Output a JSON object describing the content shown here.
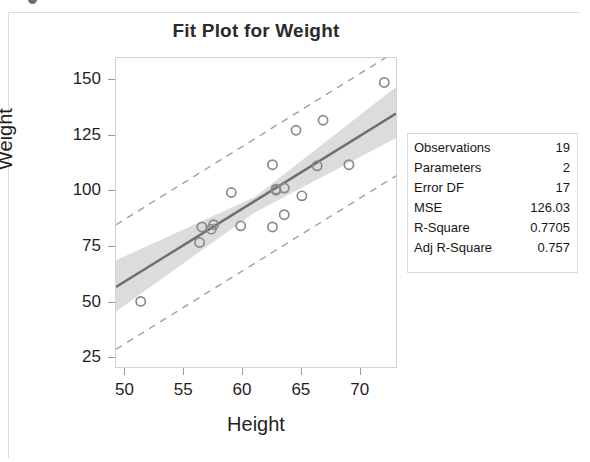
{
  "figure": {
    "title": "Fit Plot for Weight",
    "top_sliver_text": "",
    "frame_color": "#dcdcdc"
  },
  "stats_box": {
    "name": "fit-summary-table",
    "rows": [
      {
        "label": "Observations",
        "value": "19"
      },
      {
        "label": "Parameters",
        "value": "2"
      },
      {
        "label": "Error DF",
        "value": "17"
      },
      {
        "label": "MSE",
        "value": "126.03"
      },
      {
        "label": "R-Square",
        "value": "0.7705"
      },
      {
        "label": "Adj R-Square",
        "value": "0.757"
      }
    ]
  },
  "chart_data": {
    "type": "scatter",
    "title": "Fit Plot for Weight",
    "xlabel": "Height",
    "ylabel": "Weight",
    "xlim": [
      49.2,
      73.0
    ],
    "ylim": [
      21.0,
      160.0
    ],
    "xticks": [
      50,
      55,
      60,
      65,
      70
    ],
    "yticks": [
      25,
      50,
      75,
      100,
      125,
      150
    ],
    "grid": false,
    "legend": "none",
    "colors": {
      "marker_stroke": "#8a8a8a",
      "fit_line": "#6e6e6e",
      "confidence_band": "#d6d6d6",
      "prediction_limit": "#a0a0a0",
      "axis": "#9a9a9a",
      "text": "#1f1f1f"
    },
    "points": [
      {
        "x": 51.3,
        "y": 50.5
      },
      {
        "x": 56.3,
        "y": 77.0
      },
      {
        "x": 56.5,
        "y": 84.0
      },
      {
        "x": 57.3,
        "y": 83.0
      },
      {
        "x": 57.5,
        "y": 85.0
      },
      {
        "x": 59.0,
        "y": 99.5
      },
      {
        "x": 59.8,
        "y": 84.5
      },
      {
        "x": 62.5,
        "y": 84.0
      },
      {
        "x": 62.5,
        "y": 112.0
      },
      {
        "x": 62.8,
        "y": 101.0
      },
      {
        "x": 63.5,
        "y": 89.5
      },
      {
        "x": 63.5,
        "y": 101.5
      },
      {
        "x": 64.5,
        "y": 127.5
      },
      {
        "x": 65.0,
        "y": 98.0
      },
      {
        "x": 66.3,
        "y": 111.5
      },
      {
        "x": 66.8,
        "y": 132.0
      },
      {
        "x": 69.0,
        "y": 112.0
      },
      {
        "x": 72.0,
        "y": 149.0
      },
      {
        "x": 62.8,
        "y": 100.5
      }
    ],
    "fit_line": {
      "label": "regression-fit",
      "endpoints": [
        {
          "x": 49.2,
          "y": 57.0
        },
        {
          "x": 73.0,
          "y": 135.0
        }
      ]
    },
    "confidence_band": {
      "label": "95% confidence limits",
      "upper": [
        {
          "x": 49.2,
          "y": 69.0
        },
        {
          "x": 61.0,
          "y": 97.5
        },
        {
          "x": 73.0,
          "y": 147.0
        }
      ],
      "lower": [
        {
          "x": 49.2,
          "y": 46.0
        },
        {
          "x": 61.0,
          "y": 90.5
        },
        {
          "x": 73.0,
          "y": 124.0
        }
      ]
    },
    "prediction_limits": {
      "label": "95% prediction limits",
      "upper": [
        {
          "x": 49.2,
          "y": 85.0
        },
        {
          "x": 73.0,
          "y": 163.0
        }
      ],
      "lower": [
        {
          "x": 49.2,
          "y": 29.0
        },
        {
          "x": 73.0,
          "y": 107.0
        }
      ]
    }
  },
  "axis_labels": {
    "x": "Height",
    "y": "Weight"
  }
}
